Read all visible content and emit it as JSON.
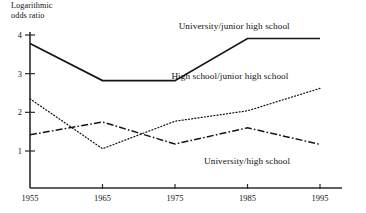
{
  "chart_data": {
    "type": "line",
    "title": "",
    "ylabel": "Logarithmic\nodds ratio",
    "xlabel": "",
    "x": [
      1955,
      1965,
      1975,
      1985,
      1995
    ],
    "xtick_labels": [
      "1955",
      "1965",
      "1975",
      "1985",
      "1995"
    ],
    "ytick_labels": [
      "1",
      "2",
      "3",
      "4"
    ],
    "yticks": [
      1,
      2,
      3,
      4
    ],
    "xlim": [
      1955,
      1995
    ],
    "ylim": [
      0,
      4.35
    ],
    "grid": false,
    "legend_position": "inline-annotations",
    "series": [
      {
        "name": "University/junior high school",
        "style": "solid",
        "values": [
          3.78,
          2.82,
          2.82,
          3.91,
          3.91
        ]
      },
      {
        "name": "High school/junior high school",
        "style": "dotted",
        "values": [
          2.35,
          1.06,
          1.77,
          2.04,
          2.62
        ]
      },
      {
        "name": "University/high school",
        "style": "dash-dot",
        "values": [
          1.42,
          1.75,
          1.18,
          1.6,
          1.17
        ]
      }
    ],
    "annotations": [
      {
        "text": "University/junior high school",
        "x": 1975.5,
        "y": 4.2
      },
      {
        "text": "High school/junior high school",
        "x": 1974.5,
        "y": 2.92
      },
      {
        "text": "University/high school",
        "x": 1979.0,
        "y": 0.72
      }
    ],
    "colors": {
      "axis": "#2b2b2b",
      "series_university_junior_high": "#111111",
      "series_high_school_junior_high": "#222222",
      "series_university_high_school": "#1a1a1a",
      "background": "#ffffff"
    }
  }
}
